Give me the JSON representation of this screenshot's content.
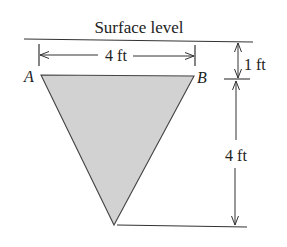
{
  "diagram": {
    "title": "Surface level",
    "points": {
      "A": "A",
      "B": "B"
    },
    "dimensions": {
      "width": "4 ft",
      "depth_to_top": "1 ft",
      "triangle_height": "4 ft"
    },
    "colors": {
      "fill": "#d2d2d2",
      "stroke": "#333333",
      "text": "#222222"
    }
  }
}
